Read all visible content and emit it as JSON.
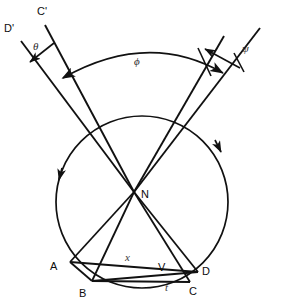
{
  "figure": {
    "background_color": "#ffffff",
    "stroke_color": "#111111",
    "width": 282,
    "height": 306
  },
  "circle": {
    "name": "main-circle",
    "center_x": 142,
    "center_y": 202,
    "radius": 86
  },
  "points": {
    "N": {
      "label": "N",
      "x": 134,
      "y": 192,
      "label_x": 142,
      "label_y": 197
    },
    "A": {
      "label": "A",
      "x": 70,
      "y": 262,
      "label_x": 53,
      "label_y": 270
    },
    "B": {
      "label": "B",
      "x": 92,
      "y": 281,
      "label_x": 82,
      "label_y": 295
    },
    "C": {
      "label": "C",
      "x": 190,
      "y": 282,
      "label_x": 193,
      "label_y": 294
    },
    "D": {
      "label": "D",
      "x": 198,
      "y": 272,
      "label_x": 203,
      "label_y": 275
    },
    "V": {
      "label": "V",
      "x": 164,
      "y": 268,
      "label_x": 160,
      "label_y": 270
    },
    "Cprime": {
      "label": "C'",
      "x": 44,
      "y": 22,
      "label_x": 37,
      "label_y": 15
    },
    "Dprime": {
      "label": "D'",
      "x": 20,
      "y": 38,
      "label_x": 6,
      "label_y": 31
    }
  },
  "angles": {
    "theta": {
      "label": "θ",
      "x": 37,
      "y": 47
    },
    "phi": {
      "label": "ϕ",
      "x": 138,
      "y": 62
    },
    "psi": {
      "label": "ψ",
      "x": 246,
      "y": 49
    }
  },
  "segments": {
    "x": {
      "label": "x",
      "x": 128,
      "y": 258
    },
    "t": {
      "label": "t",
      "x": 167,
      "y": 287
    }
  },
  "caption": {
    "text": ""
  }
}
